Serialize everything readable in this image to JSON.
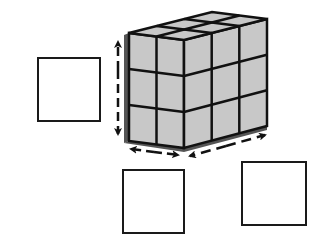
{
  "diagram": {
    "title": "",
    "prism": {
      "front_columns": 2,
      "side_columns": 3,
      "rows": 3,
      "cube_fill": "#c8c8c8",
      "edge_color": "#111111",
      "shadow_color": "#555555"
    },
    "arrows": [
      {
        "id": "height",
        "label": "height",
        "style": "dashed"
      },
      {
        "id": "width",
        "label": "width",
        "style": "dashed"
      },
      {
        "id": "length",
        "label": "length",
        "style": "dashed"
      }
    ],
    "answer_boxes": [
      {
        "id": "height-box",
        "value": ""
      },
      {
        "id": "width-box",
        "value": ""
      },
      {
        "id": "length-box",
        "value": ""
      }
    ]
  }
}
